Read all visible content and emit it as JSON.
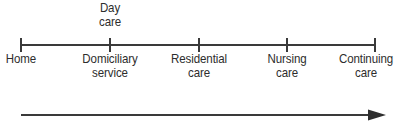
{
  "figure": {
    "kind": "continuum-spectrum-diagram",
    "background_color": "#ffffff",
    "ink_color": "#2d2d2d",
    "line_color": "#3a3a3a"
  },
  "axis": {
    "name": "care-continuum-axis",
    "start_x": 21,
    "end_x": 375,
    "y": 45,
    "tick_count": 5
  },
  "stages": [
    {
      "id": "home",
      "position": "below",
      "x": 21,
      "lines": [
        "Home"
      ],
      "line1": "Home",
      "line2": ""
    },
    {
      "id": "domiciliary-service",
      "position": "below",
      "x": 110,
      "lines": [
        "Domiciliary",
        "service"
      ],
      "line1": "Domiciliary",
      "line2": "service"
    },
    {
      "id": "residential-care",
      "position": "below",
      "x": 199,
      "lines": [
        "Residential",
        "care"
      ],
      "line1": "Residential",
      "line2": "care"
    },
    {
      "id": "nursing-care",
      "position": "below",
      "x": 287,
      "lines": [
        "Nursing",
        "care"
      ],
      "line1": "Nursing",
      "line2": "care"
    },
    {
      "id": "continuing-care",
      "position": "below",
      "x": 375,
      "lines": [
        "Continuing",
        "care"
      ],
      "line1": "Continuing",
      "line2": "care"
    }
  ],
  "above_labels": [
    {
      "id": "day-care",
      "x": 110,
      "lines": [
        "Day",
        "care"
      ],
      "line1": "Day",
      "line2": "care"
    }
  ],
  "flow_arrow": {
    "name": "increasing-dependency-arrow",
    "start_x": 21,
    "end_x": 386,
    "y": 115,
    "direction": "right",
    "label": ""
  }
}
